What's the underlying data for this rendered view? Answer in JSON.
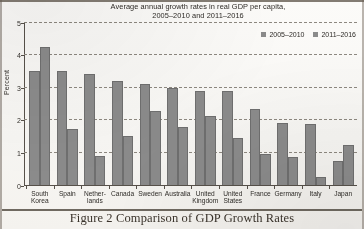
{
  "figure": {
    "caption": "Figure 2 Comparison of GDP Growth Rates"
  },
  "chart_data": {
    "type": "bar",
    "title": "Average annual growth rates in real GDP per capita,",
    "title_line2": "2005–2010 and 2011–2016",
    "xlabel": "",
    "ylabel": "Percent",
    "ylim": [
      0,
      5
    ],
    "yticks": [
      "0",
      "1",
      "2",
      "3",
      "4",
      "5"
    ],
    "grid": true,
    "legend_position": "top-right",
    "categories": [
      "South Korea",
      "Spain",
      "Netherlands",
      "Canada",
      "Sweden",
      "Australia",
      "United Kingdom",
      "United States",
      "France",
      "Germany",
      "Italy",
      "Japan"
    ],
    "category_lines": [
      [
        "South",
        "Korea"
      ],
      [
        "Spain",
        ""
      ],
      [
        "Nether-",
        "lands"
      ],
      [
        "Canada",
        ""
      ],
      [
        "Sweden",
        ""
      ],
      [
        "Australia",
        ""
      ],
      [
        "United",
        "Kingdom"
      ],
      [
        "United",
        "States"
      ],
      [
        "France",
        ""
      ],
      [
        "Germany",
        ""
      ],
      [
        "Italy",
        ""
      ],
      [
        "Japan",
        ""
      ]
    ],
    "series": [
      {
        "name": "2005–2010",
        "color": "#8b8b8b",
        "values": [
          3.52,
          3.52,
          3.43,
          3.21,
          3.1,
          2.98,
          2.9,
          2.89,
          2.36,
          1.91,
          1.89,
          0.76
        ]
      },
      {
        "name": "2011–2016",
        "color": "#8b8b8b",
        "values": [
          4.26,
          1.73,
          0.9,
          1.52,
          2.3,
          1.8,
          2.12,
          1.47,
          0.98,
          0.86,
          0.27,
          1.25
        ]
      }
    ]
  }
}
